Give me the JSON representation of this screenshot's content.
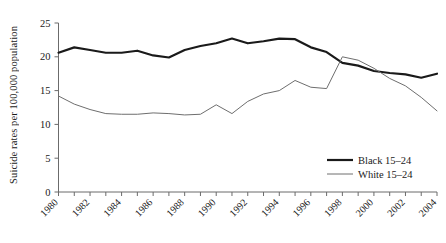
{
  "chart_data": {
    "type": "line",
    "title": "",
    "xlabel": "",
    "ylabel": "Suicide rates per 100,000 population",
    "xlim": [
      1980,
      2004
    ],
    "ylim": [
      0,
      25
    ],
    "yticks": [
      0,
      5,
      10,
      15,
      20,
      25
    ],
    "ytick_labels": [
      "0",
      "5",
      "10",
      "15",
      "20",
      "25"
    ],
    "xticks": [
      1980,
      1982,
      1984,
      1986,
      1988,
      1990,
      1992,
      1994,
      1996,
      1998,
      2000,
      2002,
      2004
    ],
    "xtick_labels": [
      "1980",
      "1982",
      "1984",
      "1986",
      "1988",
      "1990",
      "1992",
      "1994",
      "1996",
      "1998",
      "2000",
      "2002",
      "2004"
    ],
    "x": [
      1980,
      1981,
      1982,
      1983,
      1984,
      1985,
      1986,
      1987,
      1988,
      1989,
      1990,
      1991,
      1992,
      1993,
      1994,
      1995,
      1996,
      1997,
      1998,
      1999,
      2000,
      2001,
      2002,
      2003,
      2004
    ],
    "grid": false,
    "legend_position": "right-bottom",
    "series": [
      {
        "name": "Black 15–24",
        "color": "#1a1a1a",
        "width": 2.2,
        "values": [
          20.6,
          21.4,
          21.0,
          20.6,
          20.6,
          20.9,
          20.2,
          19.9,
          21.0,
          21.6,
          22.0,
          22.7,
          22.0,
          22.3,
          22.7,
          22.6,
          21.4,
          20.7,
          19.1,
          18.7,
          17.9,
          17.6,
          17.4,
          16.9,
          17.5
        ]
      },
      {
        "name": "White 15–24",
        "color": "#6e6e6e",
        "width": 1.0,
        "values": [
          14.2,
          13.0,
          12.2,
          11.6,
          11.5,
          11.5,
          11.7,
          11.6,
          11.4,
          11.5,
          12.9,
          11.6,
          13.4,
          14.5,
          15.0,
          16.5,
          15.5,
          15.3,
          20.0,
          19.5,
          18.3,
          16.8,
          15.7,
          14.0,
          12.0
        ]
      }
    ],
    "annotations": []
  },
  "legend": {
    "items": [
      {
        "label": "Black 15–24",
        "style": "thick-line",
        "color": "#1a1a1a"
      },
      {
        "label": "White 15–24",
        "style": "thin-line",
        "color": "#6e6e6e"
      }
    ]
  }
}
